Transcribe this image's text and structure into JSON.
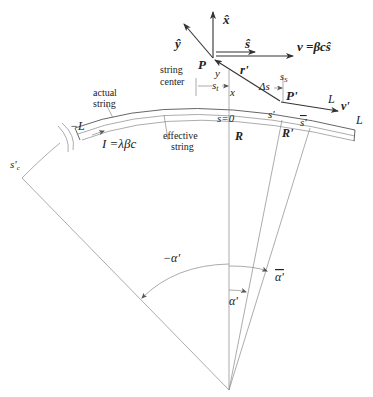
{
  "figure": {
    "type": "geometry diagram",
    "labels": {
      "x_hat": "x̂",
      "y_hat": "ŷ",
      "s_hat": "ŝ",
      "velocity": "v =βcŝ",
      "P": "P",
      "P_prime": "P'",
      "r_prime": "r'",
      "delta_s": "Δs",
      "s_s": "s",
      "s_s_sub": "S",
      "s_t": "s",
      "s_t_sub": "t",
      "x": "x",
      "y": "y",
      "s_zero": "s=0",
      "R": "R",
      "R_prime": "R'",
      "s_prime": "s'",
      "s_bar_prime": "s'",
      "s_prime_c": "s'",
      "s_prime_c_sub": "c",
      "L_end": "L",
      "L_v": "L",
      "v_prime": "v'",
      "minus_L": "−L",
      "current": "I =λβc",
      "actual_string_1": "actual",
      "actual_string_2": "string",
      "string_center_1": "string",
      "string_center_2": "center",
      "effective_string_1": "effective",
      "effective_string_2": "string",
      "minus_alpha": "−α'",
      "alpha_bar": "α'",
      "alpha": "α'"
    }
  }
}
